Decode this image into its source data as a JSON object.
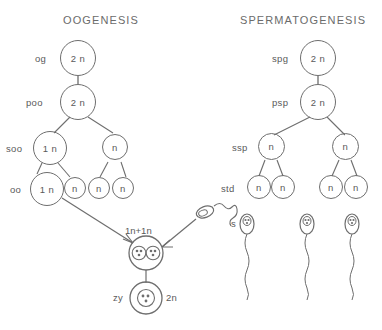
{
  "headings": {
    "left": "OOGENESIS",
    "right": "SPERMATOGENESIS"
  },
  "oogenesis": {
    "stages": [
      {
        "key": "og",
        "label": "og",
        "ploidy": "2 n",
        "size": "large"
      },
      {
        "key": "poo",
        "label": "poo",
        "ploidy": "2 n",
        "size": "large"
      },
      {
        "key": "soo",
        "label": "soo",
        "ploidy": "1 n",
        "size": "large"
      },
      {
        "key": "oo",
        "label": "oo",
        "ploidy": "1 n",
        "size": "large"
      }
    ],
    "polar_bodies": [
      {
        "ploidy": "n"
      },
      {
        "ploidy": "n"
      },
      {
        "ploidy": "n"
      },
      {
        "ploidy": "n"
      }
    ]
  },
  "spermatogenesis": {
    "stages": [
      {
        "key": "spg",
        "label": "spg",
        "ploidy": "2 n"
      },
      {
        "key": "psp",
        "label": "psp",
        "ploidy": "2 n"
      },
      {
        "key": "ssp",
        "label": "ssp",
        "ploidy": "n"
      },
      {
        "key": "std",
        "label": "std",
        "ploidy": "n"
      }
    ],
    "secondary_right": {
      "ploidy": "n"
    },
    "spermatids": [
      {
        "ploidy": "n"
      },
      {
        "ploidy": "n"
      },
      {
        "ploidy": "n"
      },
      {
        "ploidy": "n"
      }
    ],
    "sperm_label": "s",
    "sperm_count": 3
  },
  "fertilization": {
    "zygote_forming_label": "1n+1n",
    "zygote_label": "zy",
    "zygote_ploidy": "2n"
  },
  "colors": {
    "stroke": "#6e6e6e",
    "text": "#5a5a5a",
    "background": "#ffffff"
  }
}
